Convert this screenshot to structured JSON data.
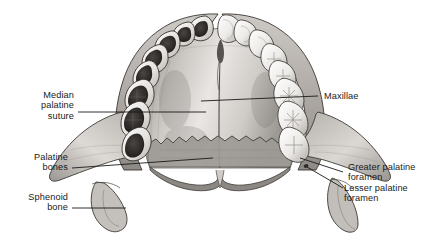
{
  "figure": {
    "background_color": "#ffffff",
    "ink_color": "#1a1a1a",
    "bone_light": "#f2f0ee",
    "bone_mid": "#b9b5b1",
    "bone_dark": "#7d7873",
    "tooth_dark": "#2f2c2a"
  },
  "labels": {
    "median_palatine_suture": {
      "line1": "Median",
      "line2": "palatine",
      "line3": "suture",
      "side": "left"
    },
    "palatine_bones": {
      "line1": "Palatine",
      "line2": "bones",
      "side": "left"
    },
    "sphenoid_bone": {
      "line1": "Sphenoid",
      "line2": "bone",
      "side": "left"
    },
    "maxillae": {
      "line1": "Maxillae",
      "side": "right"
    },
    "greater_palatine_foramen": {
      "line1": "Greater palatine",
      "line2": "foramen",
      "side": "right"
    },
    "lesser_palatine_foramen": {
      "line1": "Lesser palatine",
      "line2": "foramen",
      "side": "right"
    }
  }
}
